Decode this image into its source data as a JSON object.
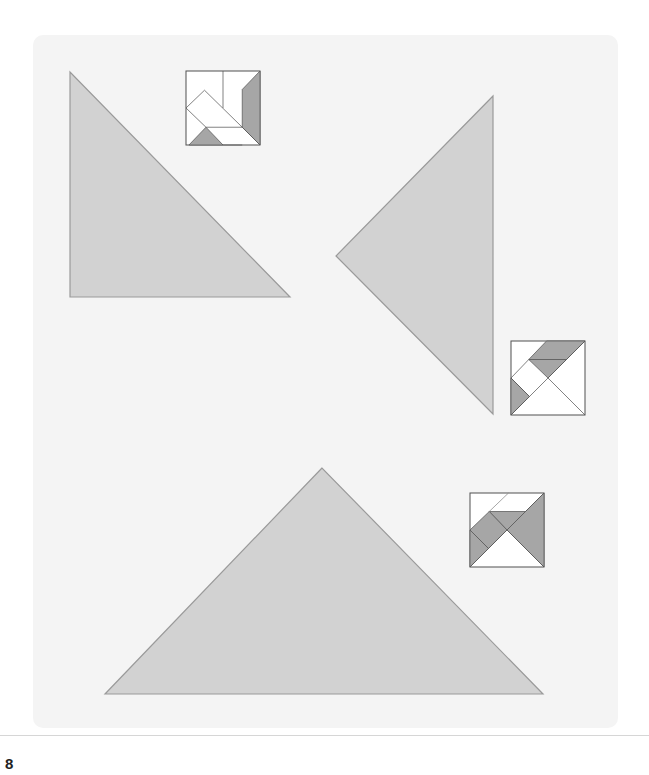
{
  "page": {
    "number": "8"
  },
  "colors": {
    "panel_bg": "#f4f4f4",
    "shape_fill": "#d2d2d2",
    "shape_stroke": "#9a9a9a",
    "thumb_piece_gray": "#a6a6a6",
    "thumb_bg": "#ffffff",
    "thumb_line": "#555555",
    "divider": "#d6d6d6"
  },
  "shapes": [
    {
      "name": "large-triangle-left",
      "points": "70,72 70,297 290,297"
    },
    {
      "name": "large-triangle-right",
      "points": "493,96 336,256 493,414"
    },
    {
      "name": "large-triangle-bottom",
      "points": "322,468 105,694 543,694"
    }
  ],
  "thumbnails": [
    {
      "name": "tangram-thumbnail-1",
      "x": 186,
      "y": 71,
      "size": 74
    },
    {
      "name": "tangram-thumbnail-2",
      "x": 511,
      "y": 341,
      "size": 74
    },
    {
      "name": "tangram-thumbnail-3",
      "x": 470,
      "y": 493,
      "size": 74
    }
  ]
}
